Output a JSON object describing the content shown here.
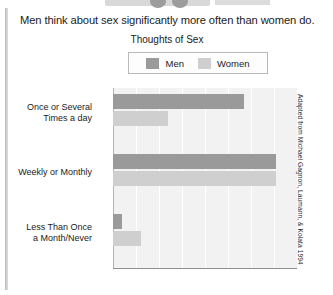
{
  "headline": "Men think about sex significantly more often than women do.",
  "attribution": "Adapted from Michael Gagnon, Laumann, & Kolata 1994",
  "legend": {
    "men_label": "Men",
    "women_label": "Women"
  },
  "colors": {
    "men": "#9a9a9a",
    "women": "#cfcfcf",
    "plot_background": "#f2f2f2",
    "grid": "#ffffff",
    "text": "#1b1b1b"
  },
  "chart_data": {
    "type": "bar",
    "orientation": "horizontal",
    "title": "Thoughts of Sex",
    "xlabel": "",
    "ylabel": "",
    "categories": [
      "Once or Several Times a day",
      "Weekly or Monthly",
      "Less Than Once a Month/Never"
    ],
    "category_lines": [
      [
        "Once or Several",
        "Times a day"
      ],
      [
        "Weekly or Monthly"
      ],
      [
        "Less Than Once",
        "a Month/Never"
      ]
    ],
    "series": [
      {
        "name": "Men",
        "values": [
          57,
          71,
          4
        ]
      },
      {
        "name": "Women",
        "values": [
          24,
          71,
          12
        ]
      }
    ],
    "xlim": [
      0,
      80
    ],
    "xticks": [
      0,
      10,
      20,
      30,
      40,
      50,
      60,
      70,
      80
    ],
    "xticklabels": [
      "0%",
      "10%",
      "20%",
      "30%",
      "40%",
      "50%",
      "60%",
      "70%",
      "80%"
    ],
    "grid": true,
    "legend_position": "top"
  }
}
